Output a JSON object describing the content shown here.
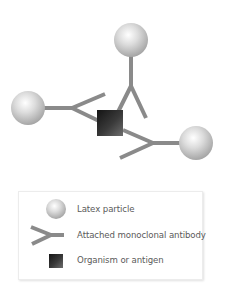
{
  "diagram": {
    "colors": {
      "sphere_highlight": "#ffffff",
      "sphere_mid": "#d6d6d6",
      "sphere_edge": "#a8a8a8",
      "antibody": "#8a8a8a",
      "antigen_dark": "#141414",
      "antigen_light": "#6a6a6a"
    },
    "antigen": {
      "x": 97,
      "y": 110,
      "size": 26
    },
    "particles": [
      {
        "id": "top",
        "cx": 131,
        "cy": 40,
        "r": 17
      },
      {
        "id": "left",
        "cx": 28,
        "cy": 108,
        "r": 17
      },
      {
        "id": "right",
        "cx": 196,
        "cy": 143,
        "r": 17
      }
    ]
  },
  "legend": {
    "items": [
      {
        "symbol": "latex-particle",
        "label": "Latex particle"
      },
      {
        "symbol": "antibody",
        "label": "Attached monoclonal antibody"
      },
      {
        "symbol": "antigen",
        "label": "Organism or antigen"
      }
    ]
  }
}
